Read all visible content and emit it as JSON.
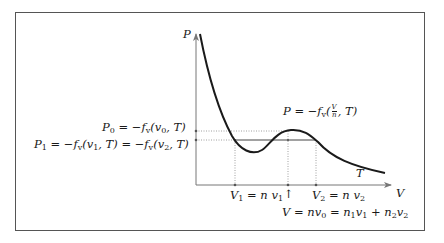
{
  "diagram": {
    "type": "pressure-volume isotherm (van der Waals loop with Maxwell construction)",
    "axes": {
      "y_label": "P",
      "x_label": "V"
    },
    "curve_label": "T",
    "curve_equation": {
      "prefix": "P = −f",
      "sub": "v",
      "frac_num": "V",
      "frac_den": "n",
      "suffix": ", T)"
    },
    "level_labels": {
      "p0": {
        "main": "P",
        "sub": "0",
        "rest": " = −f",
        "sub2": "v",
        "rest2": "(v",
        "sub3": "0",
        "rest3": ", T)"
      },
      "p1": {
        "text_a": "P",
        "sub_a": "1",
        "text_b": " = −f",
        "sub_b": "v",
        "text_c": "(v",
        "sub_c": "1",
        "text_d": ", T) = −f",
        "sub_d": "v",
        "text_e": "(v",
        "sub_e": "2",
        "text_f": ", T)"
      }
    },
    "x_ticks": {
      "v1": {
        "a": "V",
        "sub_a": "1",
        "b": " = n v",
        "sub_b": "1"
      },
      "arrow": "↑",
      "v2": {
        "a": "V",
        "sub_a": "2",
        "b": " = n v",
        "sub_b": "2"
      }
    },
    "volume_relation": {
      "a": "V = nv",
      "s1": "0",
      "b": " = n",
      "s2": "1",
      "c": "v",
      "s3": "1",
      "d": " + n",
      "s4": "2",
      "e": "v",
      "s5": "2"
    },
    "colors": {
      "curve": "#1a1a1a",
      "axis": "#777777",
      "guide": "#888888",
      "frame": "#555555"
    }
  }
}
